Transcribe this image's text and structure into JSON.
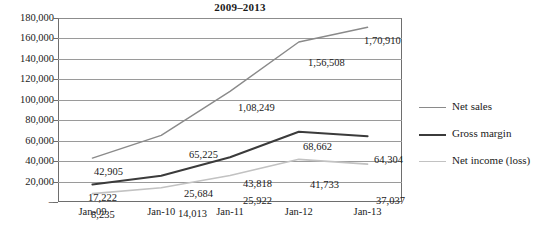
{
  "chart_data": {
    "type": "line",
    "title": "2009–2013",
    "xlabel": "",
    "ylabel": "",
    "categories": [
      "Jan-09",
      "Jan-10",
      "Jan-11",
      "Jan-12",
      "Jan-13"
    ],
    "ylim": [
      0,
      180000
    ],
    "ytick_step": 20000,
    "ytick_labels": [
      "180,000",
      "160,000",
      "140,000",
      "120,000",
      "100,000",
      "80,000",
      "60,000",
      "40,000",
      "20,000",
      "–"
    ],
    "ytick_values": [
      180000,
      160000,
      140000,
      120000,
      100000,
      80000,
      60000,
      40000,
      20000,
      0
    ],
    "grid": true,
    "legend_position": "right",
    "series": [
      {
        "name": "Net sales",
        "color": "#8a8a8a",
        "width": 1.4,
        "values": [
          42905,
          65225,
          108249,
          156508,
          170910
        ],
        "labels": [
          "42,905",
          "65,225",
          "1,08,249",
          "1,56,508",
          "1,70,910"
        ]
      },
      {
        "name": "Gross margin",
        "color": "#3b3b3b",
        "width": 2.0,
        "values": [
          17222,
          25684,
          43818,
          68662,
          64304
        ],
        "labels": [
          "17,222",
          "25,684",
          "43,818",
          "68,662",
          "64,304"
        ]
      },
      {
        "name": "Net income (loss)",
        "color": "#c2c2c2",
        "width": 1.6,
        "values": [
          8235,
          14013,
          25922,
          41733,
          37037
        ],
        "labels": [
          "8,235",
          "14,013",
          "25,922",
          "41,733",
          "37,037"
        ]
      }
    ]
  },
  "legend": {
    "items": [
      {
        "label": "Net sales",
        "color": "#8a8a8a",
        "width": 1.4
      },
      {
        "label": "Gross margin",
        "color": "#3b3b3b",
        "width": 2.2
      },
      {
        "label": "Net income (loss)",
        "color": "#c2c2c2",
        "width": 1.8
      }
    ]
  },
  "data_labels": [
    {
      "text": "42,905",
      "x": 36,
      "y": 148,
      "series": "Net sales"
    },
    {
      "text": "65,225",
      "x": 131,
      "y": 131,
      "series": "Net sales"
    },
    {
      "text": "1,08,249",
      "x": 180,
      "y": 84,
      "series": "Net sales"
    },
    {
      "text": "1,56,508",
      "x": 250,
      "y": 39,
      "series": "Net sales"
    },
    {
      "text": "1,70,910",
      "x": 306,
      "y": 17,
      "series": "Net sales"
    },
    {
      "text": "17,222",
      "x": 30,
      "y": 174,
      "series": "Gross margin"
    },
    {
      "text": "25,684",
      "x": 126,
      "y": 170,
      "series": "Gross margin"
    },
    {
      "text": "43,818",
      "x": 185,
      "y": 160,
      "series": "Gross margin"
    },
    {
      "text": "68,662",
      "x": 245,
      "y": 123,
      "series": "Gross margin"
    },
    {
      "text": "64,304",
      "x": 316,
      "y": 136,
      "series": "Gross margin"
    },
    {
      "text": "8,235",
      "x": 33,
      "y": 191,
      "series": "Net income (loss)"
    },
    {
      "text": "14,013",
      "x": 120,
      "y": 190,
      "series": "Net income (loss)"
    },
    {
      "text": "25,922",
      "x": 185,
      "y": 177,
      "series": "Net income (loss)"
    },
    {
      "text": "41,733",
      "x": 252,
      "y": 161,
      "series": "Net income (loss)"
    },
    {
      "text": "37,037",
      "x": 318,
      "y": 177,
      "series": "Net income (loss)"
    }
  ]
}
